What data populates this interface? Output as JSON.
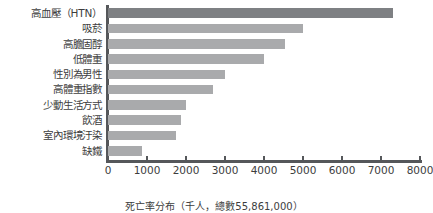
{
  "chart_data": {
    "type": "bar",
    "orientation": "horizontal",
    "title": "",
    "subtitle": "",
    "xlabel": "死亡率分布（千人，總數55,861,000）",
    "ylabel": "",
    "xlim": [
      0,
      8000
    ],
    "grid": false,
    "legend": null,
    "categories": [
      "高血壓（HTN）",
      "吸菸",
      "高膽固醇",
      "低體重",
      "性別為男性",
      "高體重指數",
      "少動生活方式",
      "飲酒",
      "室內環境汙染",
      "缺鐵"
    ],
    "values": [
      7300,
      5000,
      4550,
      4000,
      3000,
      2700,
      2000,
      1870,
      1750,
      860
    ],
    "xticks": [
      0,
      1000,
      2000,
      3000,
      4000,
      5000,
      6000,
      7000,
      8000
    ],
    "xtick_labels": [
      "0",
      "1000",
      "2000",
      "3000",
      "4000",
      "5000",
      "6000",
      "7000",
      "8000"
    ],
    "highlight_index": 0,
    "colors": {
      "bar": "#a9aaac",
      "bar_highlight": "#7e8083",
      "axis": "#55575a",
      "text": "#3d3d3d",
      "background": "#ffffff"
    }
  },
  "caption": {
    "text": "死亡率分布（千人，總數55,861,000）"
  }
}
